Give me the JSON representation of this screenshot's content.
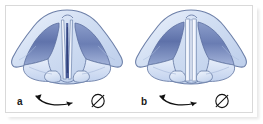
{
  "figure": {
    "type": "anatomical-illustration",
    "background_color": "#ffffff",
    "frame_color": "#d9d9d9",
    "palette": {
      "outline": "#6c7fa8",
      "cartilage_light": "#dfe8f6",
      "cartilage_mid": "#c3d4ee",
      "vestibule_dark": "#5a6ea8",
      "vestibule_mid": "#8fa4cf",
      "fold_highlight": "#f2f6fd",
      "arrow": "#111111",
      "label_text": "#1a1a1a"
    },
    "panels": [
      {
        "id": "a",
        "label": "a",
        "arrow": {
          "name": "curved-double-arrow",
          "direction": "bidirectional",
          "description": "curved double-headed arrow below larynx"
        },
        "symbol": {
          "name": "diameter-symbol",
          "glyph": "⌀",
          "description": "slashed circle / diameter sign"
        },
        "glottis_state": "narrow slit, vocal folds adducted with visible dark glottic chink"
      },
      {
        "id": "b",
        "label": "b",
        "arrow": {
          "name": "curved-double-arrow",
          "direction": "bidirectional",
          "description": "curved double-headed arrow below larynx"
        },
        "symbol": {
          "name": "diameter-symbol",
          "glyph": "⌀",
          "description": "slashed circle / diameter sign"
        },
        "glottis_state": "vocal folds closed, straight parallel pale bands"
      }
    ]
  }
}
